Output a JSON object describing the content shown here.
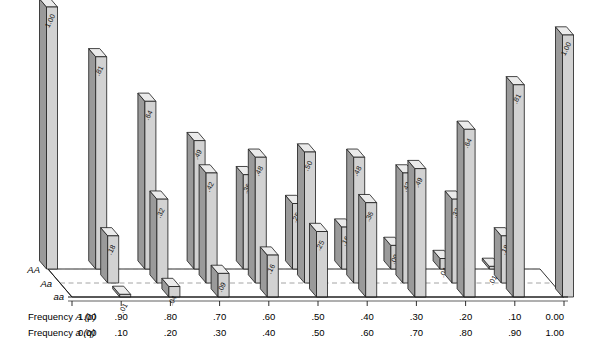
{
  "figure": {
    "kind": "hardy-weinberg-3d-bar-chart",
    "depth_axis": {
      "labels": [
        "AA",
        "Aa",
        "aa"
      ]
    },
    "x_axis": {
      "rows": [
        {
          "label_main": "Frequency",
          "label_italic": "A",
          "label_paren": "(p)",
          "ticks": [
            "1.00",
            ".90",
            ".80",
            ".70",
            ".60",
            ".50",
            ".40",
            ".30",
            ".20",
            ".10",
            "0.00"
          ]
        },
        {
          "label_main": "Frequency",
          "label_italic": "a",
          "label_paren": "(q)",
          "ticks": [
            "0.00",
            ".10",
            ".20",
            ".30",
            ".40",
            ".50",
            ".60",
            ".70",
            ".80",
            ".90",
            "1.00"
          ]
        }
      ]
    },
    "colors": {
      "bar_front": "#d2d2d2",
      "bar_top": "#ebebeb",
      "bar_side": "#9a9a9a",
      "outline": "#1a1a1a",
      "floor": "#ffffff",
      "grid_dash": "#8d8d8d"
    }
  },
  "chart_data": {
    "type": "bar",
    "title": "",
    "xlabel": "Frequency A (p) / Frequency a (q)",
    "ylabel": "Genotype frequency",
    "zlabel": "Genotype",
    "ylim": [
      0,
      1
    ],
    "grid": true,
    "legend": "none",
    "categories": [
      "1.00",
      ".90",
      ".80",
      ".70",
      ".60",
      ".50",
      ".40",
      ".30",
      ".20",
      ".10",
      "0.00"
    ],
    "x_secondary": [
      "0.00",
      ".10",
      ".20",
      ".30",
      ".40",
      ".50",
      ".60",
      ".70",
      ".80",
      ".90",
      "1.00"
    ],
    "series": [
      {
        "name": "AA",
        "values": [
          1.0,
          0.81,
          0.64,
          0.49,
          0.36,
          0.25,
          0.16,
          0.09,
          0.04,
          0.01,
          0.0
        ],
        "labels": [
          "1.00",
          ".81",
          ".64",
          ".49",
          ".36",
          ".25",
          ".16",
          ".09",
          ".04",
          ".01",
          ""
        ]
      },
      {
        "name": "Aa",
        "values": [
          0.0,
          0.18,
          0.32,
          0.42,
          0.48,
          0.5,
          0.48,
          0.42,
          0.32,
          0.18,
          0.0
        ],
        "labels": [
          "",
          ".18",
          ".32",
          ".42",
          ".48",
          ".50",
          ".48",
          ".42",
          ".32",
          ".18",
          ""
        ]
      },
      {
        "name": "aa",
        "values": [
          0.0,
          0.01,
          0.04,
          0.09,
          0.16,
          0.25,
          0.36,
          0.49,
          0.64,
          0.81,
          1.0
        ],
        "labels": [
          "",
          ".01",
          ".04",
          ".09",
          ".16",
          ".25",
          ".36",
          ".49",
          ".64",
          ".81",
          "1.00"
        ]
      }
    ]
  }
}
